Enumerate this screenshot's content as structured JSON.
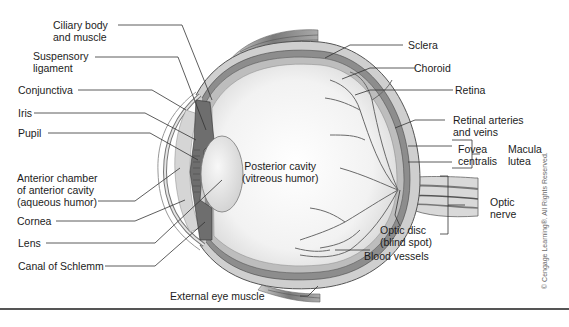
{
  "diagram": {
    "type": "anatomical-illustration",
    "labels_left": [
      {
        "id": "ciliary",
        "lines": [
          "Ciliary body",
          "and muscle"
        ]
      },
      {
        "id": "suspensory",
        "lines": [
          "Suspensory",
          "ligament"
        ]
      },
      {
        "id": "conjunctiva",
        "lines": [
          "Conjunctiva"
        ]
      },
      {
        "id": "iris",
        "lines": [
          "Iris"
        ]
      },
      {
        "id": "pupil",
        "lines": [
          "Pupil"
        ]
      },
      {
        "id": "anterior",
        "lines": [
          "Anterior chamber",
          "of anterior cavity",
          "(aqueous humor)"
        ]
      },
      {
        "id": "cornea",
        "lines": [
          "Cornea"
        ]
      },
      {
        "id": "lens",
        "lines": [
          "Lens"
        ]
      },
      {
        "id": "schlemm",
        "lines": [
          "Canal of Schlemm"
        ]
      }
    ],
    "labels_right": [
      {
        "id": "sclera",
        "lines": [
          "Sclera"
        ]
      },
      {
        "id": "choroid",
        "lines": [
          "Choroid"
        ]
      },
      {
        "id": "retina",
        "lines": [
          "Retina"
        ]
      },
      {
        "id": "retinal_vessels",
        "lines": [
          "Retinal arteries",
          "and veins"
        ]
      },
      {
        "id": "fovea",
        "lines": [
          "Fovea",
          "centralis"
        ]
      },
      {
        "id": "macula",
        "lines": [
          "Macula",
          "lutea"
        ]
      },
      {
        "id": "optic_nerve",
        "lines": [
          "Optic",
          "nerve"
        ]
      },
      {
        "id": "optic_disc",
        "lines": [
          "Optic disc",
          "(blind spot)"
        ]
      },
      {
        "id": "blood_vessels",
        "lines": [
          "Blood vessels"
        ]
      }
    ],
    "labels_center": [
      {
        "id": "posterior",
        "lines": [
          "Posterior cavity",
          "(vitreous humor)"
        ]
      }
    ],
    "labels_bottom": [
      {
        "id": "external_muscle",
        "lines": [
          "External eye muscle"
        ]
      }
    ],
    "copyright": "© Cengage Learning®. All Rights Reserved."
  }
}
